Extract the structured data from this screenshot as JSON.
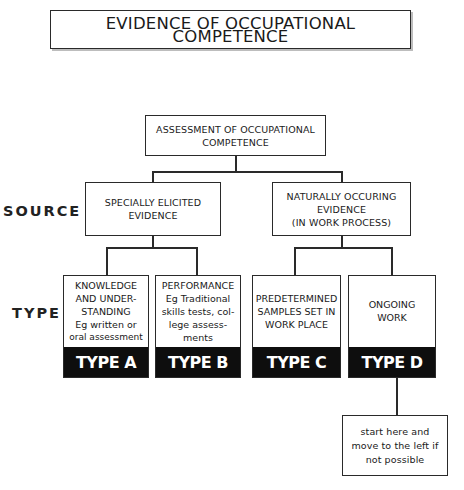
{
  "title": "EVIDENCE OF OCCUPATIONAL COMPETENCE",
  "row_labels": {
    "source": "SOURCE",
    "type": "TYPE"
  },
  "root": {
    "lines": [
      "ASSESSMENT OF OCCUPATIONAL",
      "COMPETENCE"
    ]
  },
  "sources": [
    {
      "lines": [
        "SPECIALLY ELICITED",
        "EVIDENCE"
      ]
    },
    {
      "lines": [
        "NATURALLY OCCURING",
        "EVIDENCE",
        "(IN WORK PROCESS)"
      ]
    }
  ],
  "types": [
    {
      "lines": [
        "KNOWLEDGE",
        "AND UNDER-",
        "STANDING",
        "Eg written or",
        "oral assessment"
      ],
      "label": "TYPE A"
    },
    {
      "lines": [
        "PERFORMANCE",
        "Eg Traditional",
        "skills tests, col-",
        "lege assess-",
        "ments"
      ],
      "label": "TYPE B"
    },
    {
      "lines": [
        "PREDETERMINED",
        "SAMPLES SET IN",
        "WORK PLACE"
      ],
      "label": "TYPE C"
    },
    {
      "lines": [
        "ONGOING",
        "WORK"
      ],
      "label": "TYPE D"
    }
  ],
  "note": {
    "lines": [
      "start here and",
      "move to the left if",
      "not possible"
    ]
  },
  "colors": {
    "line": "#2a2a2a",
    "type_footer_bg": "#0e0e0e",
    "type_footer_text": "#ffffff",
    "background": "#ffffff"
  }
}
